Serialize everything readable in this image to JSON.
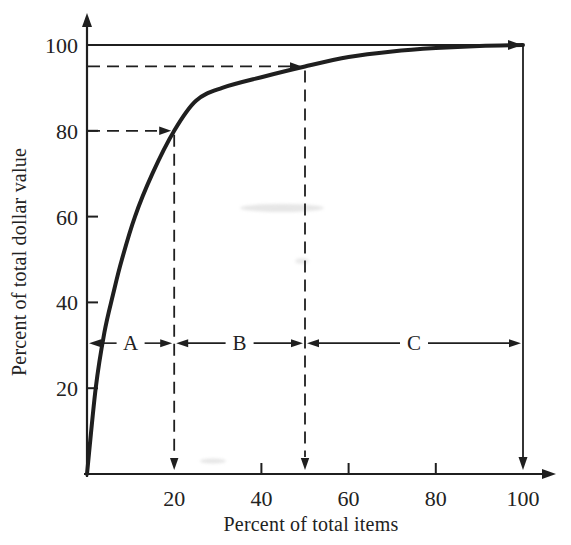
{
  "page": {
    "background": "#ffffff",
    "ink": "#1f1f1f",
    "text_color": "#222222"
  },
  "chart_data": {
    "type": "line",
    "title": "",
    "xlabel": "Percent of total items",
    "ylabel": "Percent of total dollar value",
    "xlim": [
      0,
      100
    ],
    "ylim": [
      0,
      100
    ],
    "x_ticks": [
      20,
      40,
      60,
      80,
      100
    ],
    "y_ticks": [
      20,
      40,
      60,
      80,
      100
    ],
    "x_tick_labels": [
      "20",
      "40",
      "60",
      "80",
      "100"
    ],
    "y_tick_labels": [
      "20",
      "40",
      "60",
      "80",
      "100"
    ],
    "grid": "off",
    "legend": "none",
    "curve_points": [
      [
        0,
        0
      ],
      [
        2,
        20
      ],
      [
        4,
        33
      ],
      [
        6,
        42
      ],
      [
        8,
        50
      ],
      [
        11,
        60
      ],
      [
        15,
        70
      ],
      [
        20,
        80
      ],
      [
        25,
        87
      ],
      [
        31,
        90
      ],
      [
        40,
        92.5
      ],
      [
        50,
        95
      ],
      [
        60,
        97.2
      ],
      [
        70,
        98.5
      ],
      [
        80,
        99.3
      ],
      [
        90,
        99.8
      ],
      [
        100,
        100
      ]
    ],
    "guides": [
      {
        "x": 20,
        "y": 80
      },
      {
        "x": 50,
        "y": 95
      }
    ],
    "boundary_lines": {
      "top_y": 100,
      "right_x": 100
    },
    "regions": [
      {
        "label": "A",
        "from_x": 0,
        "to_x": 20
      },
      {
        "label": "B",
        "from_x": 20,
        "to_x": 50
      },
      {
        "label": "C",
        "from_x": 50,
        "to_x": 100
      }
    ],
    "region_arrow_y": 30.5
  }
}
